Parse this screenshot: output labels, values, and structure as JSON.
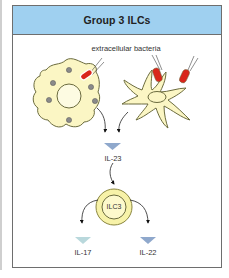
{
  "header": {
    "title": "Group 3 ILCs"
  },
  "labels": {
    "bacteria": "extracellular bacteria",
    "il23": "IL-23",
    "ilc3": "ILC3",
    "il17": "IL-17",
    "il22": "IL-22"
  },
  "colors": {
    "header_bg": "#9fd0f0",
    "cell_fill": "#fbf6c4",
    "cell_stroke": "#6b6b3e",
    "bacteria": "#d9261c",
    "granule": "#8a8a8a",
    "cytokine_blue": "#8fa8cc",
    "cytokine_teal": "#b9d8dc"
  },
  "nodes": [
    {
      "id": "macrophage",
      "type": "cell"
    },
    {
      "id": "dendritic-cell",
      "type": "cell"
    },
    {
      "id": "il23",
      "type": "cytokine"
    },
    {
      "id": "ilc3",
      "type": "cell"
    },
    {
      "id": "il17",
      "type": "cytokine"
    },
    {
      "id": "il22",
      "type": "cytokine"
    }
  ],
  "edges": [
    {
      "from": "macrophage",
      "to": "il23"
    },
    {
      "from": "dendritic-cell",
      "to": "il23"
    },
    {
      "from": "il23",
      "to": "ilc3"
    },
    {
      "from": "ilc3",
      "to": "il17"
    },
    {
      "from": "ilc3",
      "to": "il22"
    }
  ]
}
